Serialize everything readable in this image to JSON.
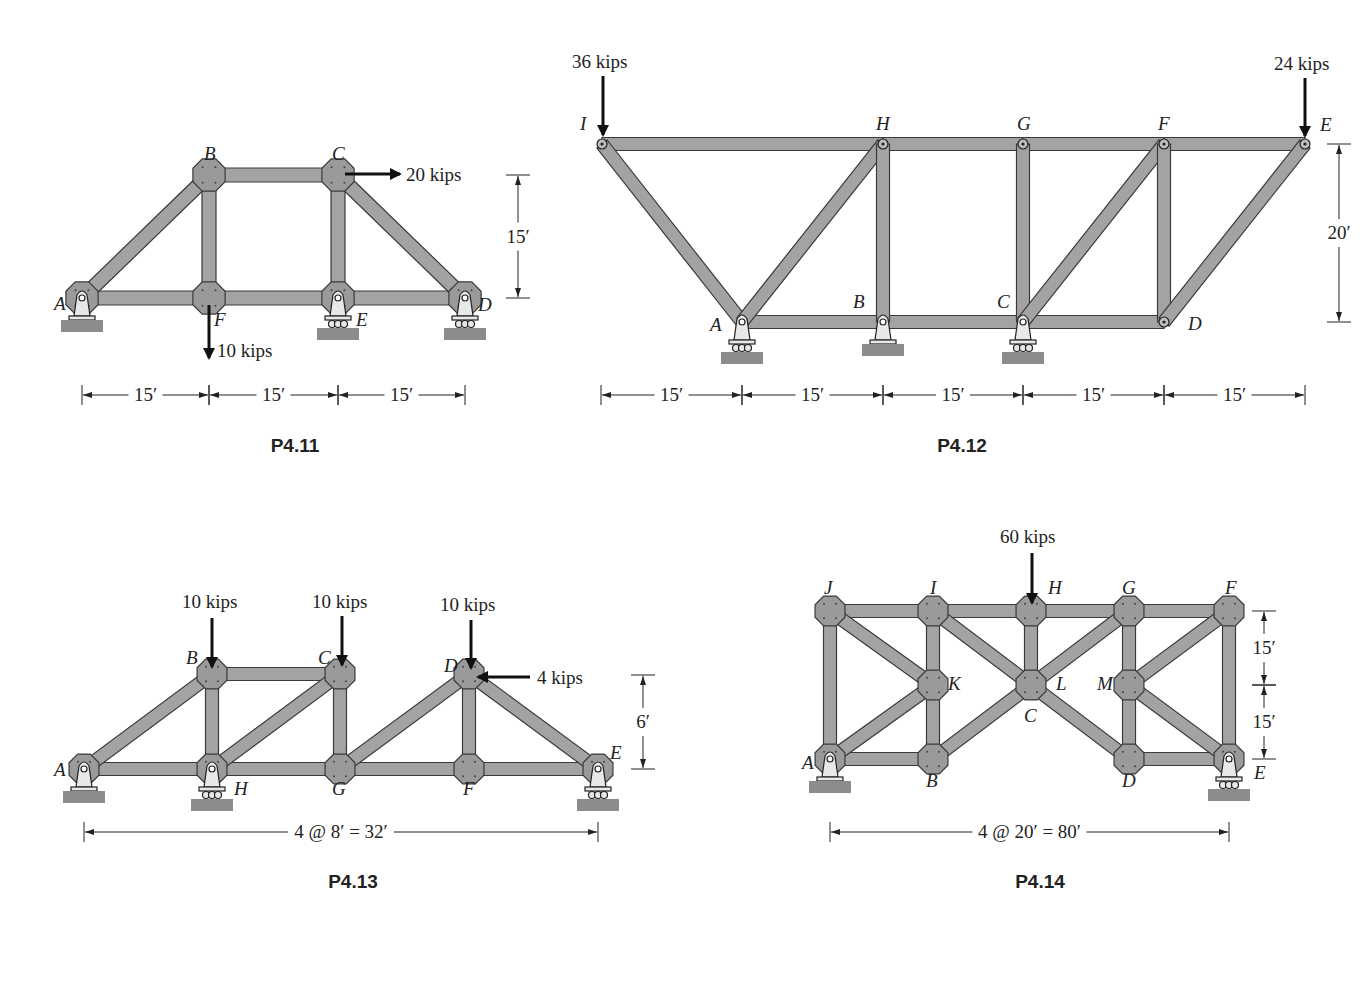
{
  "figures": [
    {
      "id": "P4.11",
      "caption": "P4.11",
      "caption_pos": [
        295,
        452
      ],
      "member_width": 14,
      "nodes": {
        "A": [
          82,
          298
        ],
        "F": [
          209,
          298
        ],
        "E": [
          338,
          298
        ],
        "D": [
          465,
          298
        ],
        "B": [
          209,
          175
        ],
        "C": [
          338,
          175
        ]
      },
      "members": [
        [
          "A",
          "F"
        ],
        [
          "F",
          "E"
        ],
        [
          "E",
          "D"
        ],
        [
          "A",
          "B"
        ],
        [
          "B",
          "C"
        ],
        [
          "C",
          "D"
        ],
        [
          "B",
          "F"
        ],
        [
          "C",
          "E"
        ]
      ],
      "gussets": [
        "A",
        "F",
        "E",
        "D",
        "B",
        "C"
      ],
      "supports": [
        {
          "node": "A",
          "type": "pin"
        },
        {
          "node": "E",
          "type": "roller"
        },
        {
          "node": "D",
          "type": "roller"
        }
      ],
      "node_labels": [
        {
          "text": "A",
          "x": 54,
          "y": 310
        },
        {
          "text": "B",
          "x": 204,
          "y": 160
        },
        {
          "text": "C",
          "x": 332,
          "y": 160
        },
        {
          "text": "D",
          "x": 478,
          "y": 311
        },
        {
          "text": "E",
          "x": 356,
          "y": 326
        },
        {
          "text": "F",
          "x": 214,
          "y": 326
        }
      ],
      "loads": [
        {
          "label": "20 kips",
          "direction": "right",
          "x1": 345,
          "y1": 174,
          "x2": 400,
          "y2": 174,
          "label_x": 406,
          "label_y": 181
        },
        {
          "label": "10 kips",
          "direction": "down",
          "x1": 209,
          "y1": 305,
          "x2": 209,
          "y2": 358,
          "label_x": 217,
          "label_y": 357
        }
      ],
      "dimensions": [
        {
          "label": "15′",
          "x1": 82,
          "y1": 395,
          "x2": 209,
          "y2": 395,
          "orient": "h"
        },
        {
          "label": "15′",
          "x1": 209,
          "y1": 395,
          "x2": 338,
          "y2": 395,
          "orient": "h"
        },
        {
          "label": "15′",
          "x1": 338,
          "y1": 395,
          "x2": 465,
          "y2": 395,
          "orient": "h"
        },
        {
          "label": "15′",
          "x1": 518,
          "y1": 175,
          "x2": 518,
          "y2": 298,
          "orient": "v"
        }
      ]
    },
    {
      "id": "P4.12",
      "caption": "P4.12",
      "caption_pos": [
        962,
        452
      ],
      "member_width": 13,
      "nodes": {
        "I": [
          602,
          144
        ],
        "H": [
          883,
          144
        ],
        "G": [
          1023,
          144
        ],
        "F": [
          1164,
          144
        ],
        "E": [
          1305,
          144
        ],
        "A": [
          742,
          322
        ],
        "B": [
          883,
          322
        ],
        "C": [
          1023,
          322
        ],
        "D": [
          1164,
          322
        ]
      },
      "members": [
        [
          "I",
          "H"
        ],
        [
          "H",
          "G"
        ],
        [
          "G",
          "F"
        ],
        [
          "F",
          "E"
        ],
        [
          "A",
          "B"
        ],
        [
          "B",
          "C"
        ],
        [
          "C",
          "D"
        ],
        [
          "I",
          "A"
        ],
        [
          "A",
          "H"
        ],
        [
          "H",
          "B"
        ],
        [
          "G",
          "C"
        ],
        [
          "C",
          "F"
        ],
        [
          "F",
          "D"
        ],
        [
          "D",
          "E"
        ]
      ],
      "gussets": [],
      "supports": [
        {
          "node": "A",
          "type": "roller"
        },
        {
          "node": "B",
          "type": "pin"
        },
        {
          "node": "C",
          "type": "roller"
        }
      ],
      "node_labels": [
        {
          "text": "I",
          "x": 580,
          "y": 130
        },
        {
          "text": "H",
          "x": 876,
          "y": 130
        },
        {
          "text": "G",
          "x": 1017,
          "y": 130
        },
        {
          "text": "F",
          "x": 1158,
          "y": 130
        },
        {
          "text": "E",
          "x": 1320,
          "y": 131
        },
        {
          "text": "A",
          "x": 710,
          "y": 331
        },
        {
          "text": "B",
          "x": 853,
          "y": 308
        },
        {
          "text": "C",
          "x": 997,
          "y": 308
        },
        {
          "text": "D",
          "x": 1188,
          "y": 330
        }
      ],
      "loads": [
        {
          "label": "36 kips",
          "direction": "down",
          "x1": 603,
          "y1": 76,
          "x2": 603,
          "y2": 135,
          "label_x": 572,
          "label_y": 68
        },
        {
          "label": "24 kips",
          "direction": "down",
          "x1": 1305,
          "y1": 78,
          "x2": 1305,
          "y2": 136,
          "label_x": 1274,
          "label_y": 70
        }
      ],
      "dimensions": [
        {
          "label": "15′",
          "x1": 601,
          "y1": 395,
          "x2": 742,
          "y2": 395,
          "orient": "h"
        },
        {
          "label": "15′",
          "x1": 742,
          "y1": 395,
          "x2": 883,
          "y2": 395,
          "orient": "h"
        },
        {
          "label": "15′",
          "x1": 883,
          "y1": 395,
          "x2": 1023,
          "y2": 395,
          "orient": "h"
        },
        {
          "label": "15′",
          "x1": 1023,
          "y1": 395,
          "x2": 1164,
          "y2": 395,
          "orient": "h"
        },
        {
          "label": "15′",
          "x1": 1164,
          "y1": 395,
          "x2": 1305,
          "y2": 395,
          "orient": "h"
        },
        {
          "label": "20′",
          "x1": 1339,
          "y1": 144,
          "x2": 1339,
          "y2": 322,
          "orient": "v"
        }
      ]
    },
    {
      "id": "P4.13",
      "caption": "P4.13",
      "caption_pos": [
        353,
        888
      ],
      "member_width": 13,
      "nodes": {
        "A": [
          84,
          769
        ],
        "H": [
          212,
          769
        ],
        "G": [
          340,
          769
        ],
        "F": [
          469,
          769
        ],
        "E": [
          598,
          769
        ],
        "B": [
          212,
          674
        ],
        "C": [
          340,
          674
        ],
        "D": [
          469,
          674
        ]
      },
      "members": [
        [
          "A",
          "H"
        ],
        [
          "H",
          "G"
        ],
        [
          "G",
          "F"
        ],
        [
          "F",
          "E"
        ],
        [
          "A",
          "B"
        ],
        [
          "B",
          "C"
        ],
        [
          "B",
          "H"
        ],
        [
          "H",
          "C"
        ],
        [
          "C",
          "G"
        ],
        [
          "G",
          "D"
        ],
        [
          "D",
          "F"
        ],
        [
          "D",
          "E"
        ]
      ],
      "gussets": [
        "A",
        "H",
        "G",
        "F",
        "E",
        "B",
        "C",
        "D"
      ],
      "supports": [
        {
          "node": "A",
          "type": "pin"
        },
        {
          "node": "H",
          "type": "roller"
        },
        {
          "node": "E",
          "type": "roller"
        }
      ],
      "node_labels": [
        {
          "text": "A",
          "x": 54,
          "y": 776
        },
        {
          "text": "B",
          "x": 186,
          "y": 664
        },
        {
          "text": "C",
          "x": 318,
          "y": 664
        },
        {
          "text": "D",
          "x": 444,
          "y": 672
        },
        {
          "text": "E",
          "x": 610,
          "y": 759
        },
        {
          "text": "H",
          "x": 234,
          "y": 795
        },
        {
          "text": "G",
          "x": 332,
          "y": 795
        },
        {
          "text": "F",
          "x": 463,
          "y": 795
        }
      ],
      "loads": [
        {
          "label": "10 kips",
          "direction": "down",
          "x1": 212,
          "y1": 618,
          "x2": 212,
          "y2": 667,
          "label_x": 182,
          "label_y": 608
        },
        {
          "label": "10 kips",
          "direction": "down",
          "x1": 342,
          "y1": 616,
          "x2": 342,
          "y2": 665,
          "label_x": 312,
          "label_y": 608
        },
        {
          "label": "10 kips",
          "direction": "down",
          "x1": 471,
          "y1": 620,
          "x2": 471,
          "y2": 668,
          "label_x": 440,
          "label_y": 611
        },
        {
          "label": "4 kips",
          "direction": "left",
          "x1": 530,
          "y1": 677,
          "x2": 478,
          "y2": 677,
          "label_x": 537,
          "label_y": 684
        }
      ],
      "dimensions": [
        {
          "label": "4 @ 8′ = 32′",
          "x1": 84,
          "y1": 832,
          "x2": 598,
          "y2": 832,
          "orient": "h"
        },
        {
          "label": "6′",
          "x1": 643,
          "y1": 675,
          "x2": 643,
          "y2": 769,
          "orient": "v"
        }
      ]
    },
    {
      "id": "P4.14",
      "caption": "P4.14",
      "caption_pos": [
        1040,
        888
      ],
      "member_width": 13,
      "nodes": {
        "J": [
          830,
          611
        ],
        "I": [
          933,
          611
        ],
        "H": [
          1031,
          611
        ],
        "G": [
          1129,
          611
        ],
        "F": [
          1229,
          611
        ],
        "K": [
          933,
          685
        ],
        "L": [
          1031,
          685
        ],
        "M": [
          1129,
          685
        ],
        "A": [
          830,
          759
        ],
        "B": [
          933,
          759
        ],
        "D": [
          1129,
          759
        ],
        "E": [
          1229,
          759
        ]
      },
      "members": [
        [
          "J",
          "I"
        ],
        [
          "I",
          "H"
        ],
        [
          "H",
          "G"
        ],
        [
          "G",
          "F"
        ],
        [
          "J",
          "A"
        ],
        [
          "F",
          "E"
        ],
        [
          "A",
          "B"
        ],
        [
          "D",
          "E"
        ],
        [
          "J",
          "K"
        ],
        [
          "A",
          "K"
        ],
        [
          "I",
          "K"
        ],
        [
          "K",
          "B"
        ],
        [
          "I",
          "L"
        ],
        [
          "H",
          "L"
        ],
        [
          "G",
          "L"
        ],
        [
          "B",
          "L"
        ],
        [
          "L",
          "D"
        ],
        [
          "G",
          "M"
        ],
        [
          "M",
          "D"
        ],
        [
          "F",
          "M"
        ],
        [
          "M",
          "E"
        ]
      ],
      "gussets": [
        "J",
        "I",
        "H",
        "G",
        "F",
        "K",
        "L",
        "M",
        "A",
        "B",
        "D",
        "E"
      ],
      "supports": [
        {
          "node": "A",
          "type": "pin"
        },
        {
          "node": "E",
          "type": "roller"
        }
      ],
      "node_labels": [
        {
          "text": "J",
          "x": 824,
          "y": 594
        },
        {
          "text": "I",
          "x": 930,
          "y": 594
        },
        {
          "text": "H",
          "x": 1048,
          "y": 594
        },
        {
          "text": "G",
          "x": 1122,
          "y": 594
        },
        {
          "text": "F",
          "x": 1225,
          "y": 594
        },
        {
          "text": "K",
          "x": 948,
          "y": 690
        },
        {
          "text": "L",
          "x": 1056,
          "y": 690
        },
        {
          "text": "M",
          "x": 1097,
          "y": 690
        },
        {
          "text": "C",
          "x": 1024,
          "y": 722
        },
        {
          "text": "A",
          "x": 802,
          "y": 769
        },
        {
          "text": "B",
          "x": 926,
          "y": 787
        },
        {
          "text": "D",
          "x": 1122,
          "y": 787
        },
        {
          "text": "E",
          "x": 1254,
          "y": 779
        }
      ],
      "loads": [
        {
          "label": "60 kips",
          "direction": "down",
          "x1": 1032,
          "y1": 553,
          "x2": 1032,
          "y2": 603,
          "label_x": 1000,
          "label_y": 543
        }
      ],
      "dimensions": [
        {
          "label": "4 @ 20′ = 80′",
          "x1": 830,
          "y1": 832,
          "x2": 1229,
          "y2": 832,
          "orient": "h"
        },
        {
          "label": "15′",
          "x1": 1264,
          "y1": 611,
          "x2": 1264,
          "y2": 685,
          "orient": "v"
        },
        {
          "label": "15′",
          "x1": 1264,
          "y1": 685,
          "x2": 1264,
          "y2": 759,
          "orient": "v"
        }
      ]
    }
  ]
}
